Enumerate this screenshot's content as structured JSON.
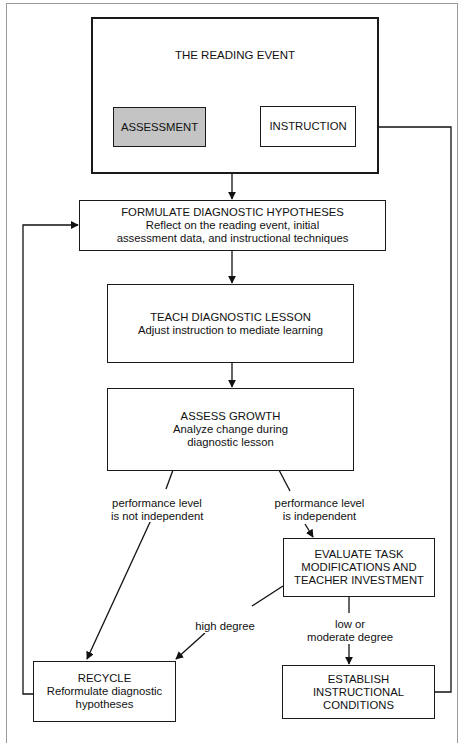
{
  "diagram": {
    "reading_event": {
      "title": "THE READING EVENT",
      "assessment": "ASSESSMENT",
      "instruction": "INSTRUCTION",
      "assessment_fill": "#c4c4c4"
    },
    "formulate": {
      "title": "FORMULATE DIAGNOSTIC HYPOTHESES",
      "line1": "Reflect on the reading event, initial",
      "line2": "assessment data, and instructional techniques"
    },
    "teach": {
      "title": "TEACH DIAGNOSTIC LESSON",
      "line1": "Adjust instruction to mediate learning"
    },
    "assess_growth": {
      "title": "ASSESS GROWTH",
      "line1": "Analyze change during",
      "line2": "diagnostic lesson"
    },
    "branch_not_independent": {
      "line1": "performance level",
      "line2": "is not independent"
    },
    "branch_independent": {
      "line1": "performance level",
      "line2": "is independent"
    },
    "evaluate": {
      "line1": "EVALUATE TASK",
      "line2": "MODIFICATIONS AND",
      "line3": "TEACHER INVESTMENT"
    },
    "high_degree": "high degree",
    "low_moderate": {
      "line1": "low or",
      "line2": "moderate degree"
    },
    "recycle": {
      "title": "RECYCLE",
      "line1": "Reformulate diagnostic",
      "line2": "hypotheses"
    },
    "establish": {
      "line1": "ESTABLISH",
      "line2": "INSTRUCTIONAL",
      "line3": "CONDITIONS"
    }
  }
}
